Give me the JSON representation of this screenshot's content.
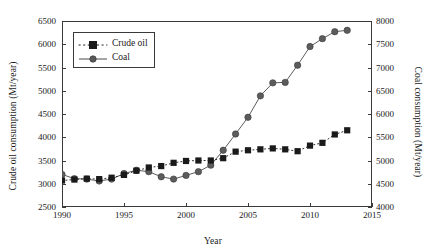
{
  "chart_data": {
    "type": "line",
    "title": "",
    "xlabel": "Year",
    "ylabel": "Crude oil consumption (Mt/year)",
    "y2label": "Coal consumption (Mt/year)",
    "xlim": [
      1990,
      2015
    ],
    "ylim": [
      2500,
      6500
    ],
    "y2lim": [
      4000,
      8000
    ],
    "xticks": [
      1990,
      1995,
      2000,
      2005,
      2010,
      2015
    ],
    "yticks": [
      2500,
      3000,
      3500,
      4000,
      4500,
      5000,
      5500,
      6000,
      6500
    ],
    "y2ticks": [
      4000,
      4500,
      5000,
      5500,
      6000,
      6500,
      7000,
      7500,
      8000
    ],
    "grid": false,
    "legend_position": "upper left",
    "series": [
      {
        "name": "Crude oil",
        "axis": "left",
        "units": "Mt/year",
        "marker": "square",
        "linestyle": "dotted",
        "color": "#1a1a1a",
        "x": [
          1990,
          1991,
          1992,
          1993,
          1994,
          1995,
          1996,
          1997,
          1998,
          1999,
          2000,
          2001,
          2002,
          2003,
          2004,
          2005,
          2006,
          2007,
          2008,
          2009,
          2010,
          2011,
          2012,
          2013
        ],
        "values": [
          3070,
          3090,
          3110,
          3100,
          3130,
          3190,
          3280,
          3350,
          3380,
          3450,
          3490,
          3500,
          3500,
          3550,
          3690,
          3720,
          3740,
          3760,
          3740,
          3700,
          3820,
          3880,
          4060,
          4150
        ]
      },
      {
        "name": "Coal",
        "axis": "right",
        "units": "Mt/year",
        "marker": "circle",
        "linestyle": "solid",
        "color": "#585858",
        "x": [
          1990,
          1991,
          1992,
          1993,
          1994,
          1995,
          1996,
          1997,
          1998,
          1999,
          2000,
          2001,
          2002,
          2003,
          2004,
          2005,
          2006,
          2007,
          2008,
          2009,
          2010,
          2011,
          2012,
          2013
        ],
        "values": [
          4700,
          4610,
          4600,
          4560,
          4600,
          4720,
          4790,
          4760,
          4650,
          4600,
          4680,
          4760,
          4900,
          5220,
          5570,
          5930,
          6390,
          6670,
          6680,
          7050,
          7450,
          7620,
          7770,
          7800
        ]
      }
    ]
  },
  "legend": {
    "items": [
      {
        "label": "Crude oil"
      },
      {
        "label": "Coal"
      }
    ]
  }
}
